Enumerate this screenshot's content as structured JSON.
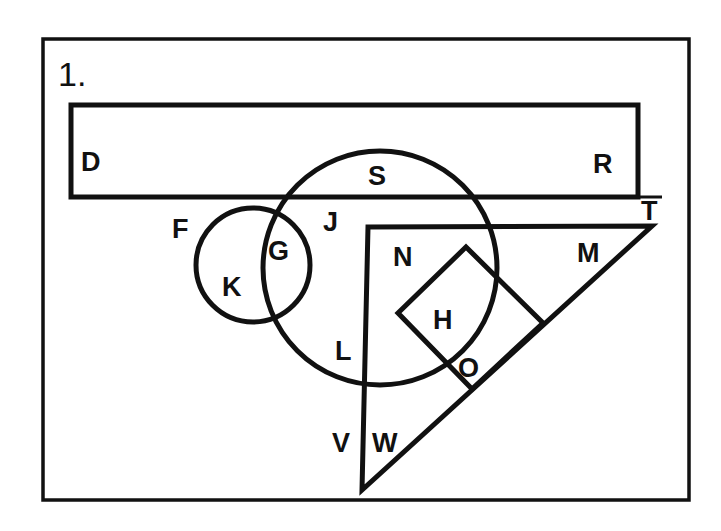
{
  "figure": {
    "number": "1.",
    "colors": {
      "ink": "#111111",
      "background": "#ffffff"
    },
    "shapes": [
      {
        "id": "outer-frame",
        "type": "rectangle"
      },
      {
        "id": "rectangle",
        "type": "rectangle"
      },
      {
        "id": "large-circle",
        "type": "circle"
      },
      {
        "id": "small-circle",
        "type": "circle"
      },
      {
        "id": "right-triangle",
        "type": "triangle"
      },
      {
        "id": "square",
        "type": "rotated-square"
      }
    ],
    "labels": {
      "D": "D",
      "R": "R",
      "S": "S",
      "T": "T",
      "F": "F",
      "G": "G",
      "J": "J",
      "K": "K",
      "N": "N",
      "M": "M",
      "H": "H",
      "L": "L",
      "O": "O",
      "V": "V",
      "W": "W"
    }
  }
}
